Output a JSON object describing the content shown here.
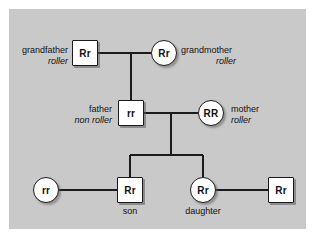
{
  "diagram": {
    "panel_color": "#c9c9c9",
    "line_color": "#1b1b1b",
    "node_fill": "#ffffff"
  },
  "nodes": {
    "grandfather": {
      "genotype": "Rr",
      "shape": "square",
      "name": "grandfather",
      "trait": "roller"
    },
    "grandmother": {
      "genotype": "Rr",
      "shape": "circle",
      "name": "grandmother",
      "trait": "roller"
    },
    "father": {
      "genotype": "rr",
      "shape": "square",
      "name": "father",
      "trait": "non roller"
    },
    "mother": {
      "genotype": "RR",
      "shape": "circle",
      "name": "mother",
      "trait": "roller"
    },
    "son_partner": {
      "genotype": "rr",
      "shape": "circle",
      "name": "",
      "trait": ""
    },
    "son": {
      "genotype": "Rr",
      "shape": "square",
      "name": "son",
      "trait": ""
    },
    "daughter": {
      "genotype": "Rr",
      "shape": "circle",
      "name": "daughter",
      "trait": ""
    },
    "daughter_partner": {
      "genotype": "Rr",
      "shape": "square",
      "name": "",
      "trait": ""
    }
  }
}
